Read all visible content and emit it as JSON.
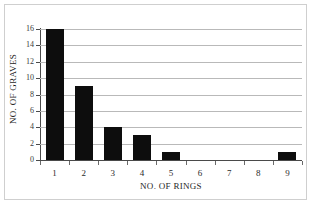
{
  "chart_data": {
    "type": "bar",
    "title": "",
    "xlabel": "NO. OF RINGS",
    "ylabel": "NO. OF GRAVES",
    "categories": [
      "1",
      "2",
      "3",
      "4",
      "5",
      "6",
      "7",
      "8",
      "9"
    ],
    "values": [
      16,
      9,
      4,
      3,
      1,
      0,
      0,
      0,
      1
    ],
    "ylim": [
      0,
      16
    ],
    "yticks": [
      0,
      2,
      4,
      6,
      8,
      10,
      12,
      14,
      16
    ],
    "ytick_labels": [
      "0",
      "2",
      "4",
      "6",
      "8",
      "10",
      "12",
      "14",
      "16"
    ],
    "grid": true,
    "grid_axis": "y",
    "legend": false,
    "legend_position": "none",
    "bar_color": "#0d0d0d",
    "gridline_color": "#b9b9b9",
    "axis_color": "#4a4a4a",
    "background_color": "#ffffff",
    "frame_color": "#cfcfcf"
  }
}
